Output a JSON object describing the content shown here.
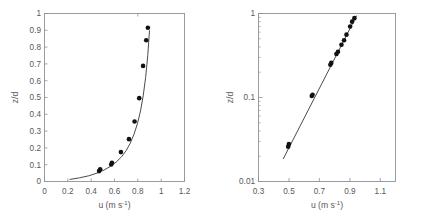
{
  "figure": {
    "background_color": "#ffffff",
    "axis_color": "#8f9194",
    "text_color": "#58585a",
    "marker_color": "#111111",
    "curve_color": "#2a2a2a"
  },
  "chart_data": [
    {
      "type": "scatter",
      "panel": "left",
      "title": "",
      "xlabel": "u (m s",
      "xlabel_sup": "-1",
      "xlabel_close": ")",
      "ylabel": "z/d",
      "xscale": "linear",
      "yscale": "linear",
      "xlim": [
        0,
        1.2
      ],
      "ylim": [
        0,
        1
      ],
      "grid": false,
      "legend": "none",
      "xticks": [
        0,
        0.2,
        0.4,
        0.6,
        0.8,
        1,
        1.2
      ],
      "xticklabels": [
        "0",
        "0.2",
        "0.4",
        "0.6",
        "0.8",
        "1",
        "1.2"
      ],
      "yticks": [
        0,
        0.1,
        0.2,
        0.3,
        0.4,
        0.5,
        0.6,
        0.7,
        0.8,
        0.9,
        1
      ],
      "yticklabels": [
        "0",
        "0.1",
        "0.2",
        "0.3",
        "0.4",
        "0.5",
        "0.6",
        "0.7",
        "0.8",
        "0.9",
        "1"
      ],
      "series": [
        {
          "name": "measured velocity profile",
          "marker": "filled-circle",
          "x": [
            0.468,
            0.477,
            0.572,
            0.578,
            0.655,
            0.724,
            0.772,
            0.812,
            0.845,
            0.872,
            0.886
          ],
          "y": [
            0.062,
            0.073,
            0.101,
            0.112,
            0.175,
            0.252,
            0.357,
            0.496,
            0.688,
            0.841,
            0.915
          ]
        },
        {
          "name": "logarithmic fit curve",
          "marker": "line",
          "x": [
            0.215,
            0.3,
            0.38,
            0.45,
            0.51,
            0.565,
            0.615,
            0.66,
            0.7,
            0.735,
            0.768,
            0.797,
            0.823,
            0.846,
            0.867,
            0.885,
            0.9
          ],
          "y": [
            0.012,
            0.022,
            0.034,
            0.05,
            0.068,
            0.09,
            0.116,
            0.147,
            0.184,
            0.228,
            0.283,
            0.345,
            0.42,
            0.51,
            0.62,
            0.75,
            0.9
          ]
        }
      ]
    },
    {
      "type": "scatter",
      "panel": "right",
      "title": "",
      "xlabel": "u (m s",
      "xlabel_sup": "-1",
      "xlabel_close": ")",
      "ylabel": "z/d",
      "xscale": "linear",
      "yscale": "log",
      "xlim": [
        0.3,
        1.2
      ],
      "ylim": [
        0.01,
        1
      ],
      "grid": false,
      "legend": "none",
      "xticks": [
        0.3,
        0.5,
        0.7,
        0.9,
        1.1
      ],
      "xticklabels": [
        "0.3",
        "0.5",
        "0.7",
        "0.9",
        "1.1"
      ],
      "yticks": [
        0.01,
        0.1,
        1
      ],
      "yticklabels": [
        "0.01",
        "0.1",
        "1"
      ],
      "yminorticks": [
        0.02,
        0.03,
        0.04,
        0.05,
        0.06,
        0.07,
        0.08,
        0.09,
        0.2,
        0.3,
        0.4,
        0.5,
        0.6,
        0.7,
        0.8,
        0.9
      ],
      "series": [
        {
          "name": "measured velocity profile",
          "marker": "filled-circle",
          "x": [
            0.495,
            0.5,
            0.65,
            0.655,
            0.772,
            0.778,
            0.812,
            0.822,
            0.845,
            0.862,
            0.878,
            0.902,
            0.915,
            0.93
          ],
          "y": [
            0.026,
            0.028,
            0.104,
            0.108,
            0.245,
            0.258,
            0.33,
            0.35,
            0.425,
            0.48,
            0.56,
            0.7,
            0.8,
            0.88
          ]
        },
        {
          "name": "log-law fit line",
          "marker": "line",
          "x": [
            0.462,
            0.945
          ],
          "y": [
            0.0185,
            0.945
          ]
        }
      ]
    }
  ]
}
